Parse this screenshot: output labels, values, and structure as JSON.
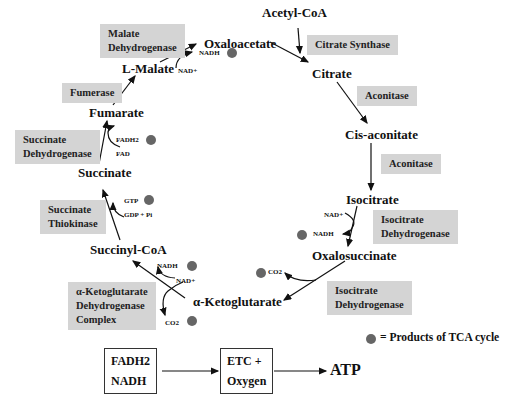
{
  "diagram": {
    "title": "TCA cycle",
    "metabolites": {
      "acetyl_coa": "Acetyl-CoA",
      "oxaloacetate": "Oxaloacetate",
      "citrate": "Citrate",
      "cis_aconitate": "Cis-aconitate",
      "isocitrate": "Isocitrate",
      "oxalosuccinate": "Oxalosuccinate",
      "alpha_ketoglutarate": "α-Ketoglutarate",
      "succinyl_coa": "Succinyl-CoA",
      "succinate": "Succinate",
      "fumarate": "Fumarate",
      "l_malate": "L-Malate"
    },
    "enzymes": {
      "malate_dh_1": "Malate",
      "malate_dh_2": "Dehydrogenase",
      "citrate_synthase": "Citrate Synthase",
      "aconitase_1": "Aconitase",
      "aconitase_2": "Aconitase",
      "isocitrate_dh_a1": "Isocitrate",
      "isocitrate_dh_a2": "Dehydrogenase",
      "isocitrate_dh_b1": "Isocitrate",
      "isocitrate_dh_b2": "Dehydrogenase",
      "akg_dh_1": "α-Ketoglutarate",
      "akg_dh_2": "Dehydrogenase",
      "akg_dh_3": "Complex",
      "succinate_thiokinase_1": "Succinate",
      "succinate_thiokinase_2": "Thiokinase",
      "succinate_dh_1": "Succinate",
      "succinate_dh_2": "Dehydrogenase",
      "fumerase": "Fumerase"
    },
    "cofactors": {
      "malate_nadh": "NADH",
      "malate_nad": "NAD+",
      "iso_nad": "NAD+",
      "iso_nadh": "NADH",
      "co2_oxalo": "CO2",
      "akg_nadh": "NADH",
      "akg_nad": "NAD+",
      "akg_co2": "CO2",
      "gtp": "GTP",
      "gdp_pi": "GDP + Pi",
      "fadh2": "FADH2",
      "fad": "FAD"
    },
    "legend": {
      "label": "= Products of TCA cycle",
      "dot_color": "#666666"
    },
    "bottom_flow": {
      "box1_line1": "FADH2",
      "box1_line2": "NADH",
      "box2_line1": "ETC  +",
      "box2_line2": "Oxygen",
      "result": "ATP"
    },
    "colors": {
      "enzyme_box": "#d4d4d4",
      "product_dot": "#666666"
    }
  }
}
